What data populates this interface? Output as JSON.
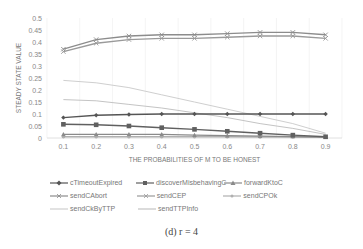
{
  "chart_data": {
    "type": "line",
    "title": "",
    "xlabel": "THE PROBABILITIES OF M TO BE HONEST",
    "ylabel": "STEADY STATE VALUE",
    "x": [
      "0.1",
      "0.2",
      "0.3",
      "0.4",
      "0.5",
      "0.6",
      "0.7",
      "0.8",
      "0.9"
    ],
    "yticks": [
      "0",
      "0.05",
      "0.1",
      "0.15",
      "0.2",
      "0.25",
      "0.3",
      "0.35",
      "0.4",
      "0.45",
      "0.5"
    ],
    "ylim": [
      0,
      0.5
    ],
    "grid": "vertical",
    "legend_position": "bottom",
    "series": [
      {
        "name": "cTimeoutExpired",
        "color": "#555555",
        "marker": "diamond",
        "values": [
          0.085,
          0.095,
          0.098,
          0.1,
          0.1,
          0.1,
          0.1,
          0.1,
          0.1
        ]
      },
      {
        "name": "discoverMisbehavingC",
        "color": "#606060",
        "marker": "square",
        "values": [
          0.057,
          0.055,
          0.05,
          0.043,
          0.036,
          0.028,
          0.02,
          0.012,
          0.005
        ]
      },
      {
        "name": "forwardKtoC",
        "color": "#8a8a8a",
        "marker": "triangle",
        "values": [
          0.015,
          0.015,
          0.015,
          0.015,
          0.012,
          0.01,
          0.008,
          0.006,
          0.004
        ]
      },
      {
        "name": "sendCAbort",
        "color": "#8c8c8c",
        "marker": "x",
        "values": [
          0.37,
          0.41,
          0.425,
          0.43,
          0.43,
          0.435,
          0.44,
          0.44,
          0.43
        ]
      },
      {
        "name": "sendCEP",
        "color": "#9a9a9a",
        "marker": "x",
        "values": [
          0.36,
          0.395,
          0.41,
          0.415,
          0.415,
          0.42,
          0.425,
          0.425,
          0.415
        ]
      },
      {
        "name": "sendCPOk",
        "color": "#b0b0b0",
        "marker": "circle",
        "values": [
          0.005,
          0.005,
          0.005,
          0.005,
          0.005,
          0.005,
          0.004,
          0.004,
          0.003
        ]
      },
      {
        "name": "sendCkByTTP",
        "color": "#cfcfcf",
        "marker": "none",
        "values": [
          0.24,
          0.23,
          0.21,
          0.18,
          0.15,
          0.12,
          0.09,
          0.06,
          0.02
        ]
      },
      {
        "name": "sendTTPInfo",
        "color": "#c4c4c4",
        "marker": "none",
        "values": [
          0.16,
          0.155,
          0.14,
          0.125,
          0.105,
          0.085,
          0.06,
          0.04,
          0.015
        ]
      }
    ]
  },
  "caption": "(d) r = 4"
}
